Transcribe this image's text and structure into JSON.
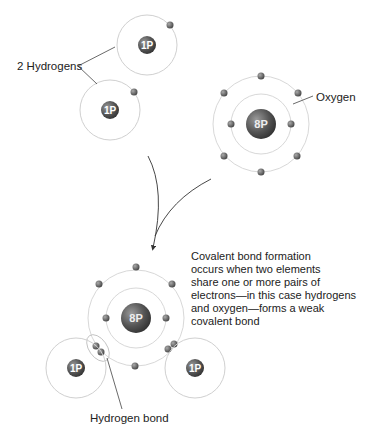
{
  "labels": {
    "hydrogens": "2 Hydrogens",
    "oxygen": "Oxygen",
    "hydrogen_bond": "Hydrogen bond",
    "caption": "Covalent bond formation\noccurs when two elements\nshare one or more pairs of\nelectrons—in this case hydrogens\nand oxygen—forms a weak\ncovalent bond"
  },
  "atoms": {
    "hydrogen_nucleus": "1P",
    "oxygen_nucleus": "8P"
  },
  "colors": {
    "orbit": "#d0d0d0",
    "nucleus": "#5a5a5a",
    "electron": "#6a6a6a",
    "line": "#444444",
    "text": "#222222"
  }
}
